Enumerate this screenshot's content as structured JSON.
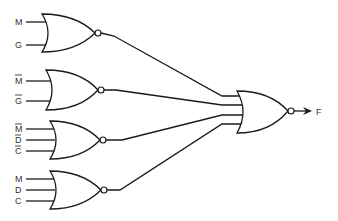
{
  "diagram": {
    "type": "logic-circuit",
    "gate_type": "NOR",
    "output_label": "F",
    "gates": [
      {
        "id": "g1",
        "inputs": [
          {
            "label": "M",
            "negated": false
          },
          {
            "label": "G",
            "negated": false
          }
        ]
      },
      {
        "id": "g2",
        "inputs": [
          {
            "label": "M",
            "negated": true
          },
          {
            "label": "G",
            "negated": true
          }
        ]
      },
      {
        "id": "g3",
        "inputs": [
          {
            "label": "M",
            "negated": true
          },
          {
            "label": "D",
            "negated": true
          },
          {
            "label": "C",
            "negated": true
          }
        ]
      },
      {
        "id": "g4",
        "inputs": [
          {
            "label": "M",
            "negated": false
          },
          {
            "label": "D",
            "negated": false
          },
          {
            "label": "C",
            "negated": false
          }
        ]
      }
    ],
    "final_gate": {
      "id": "g5",
      "inputs": [
        "g1",
        "g2",
        "g3",
        "g4"
      ],
      "output": "F"
    }
  }
}
